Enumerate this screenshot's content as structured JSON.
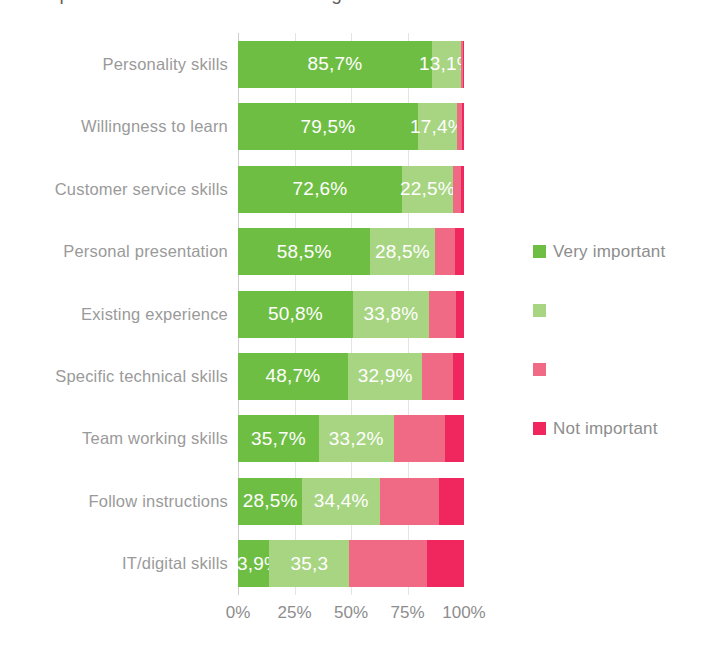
{
  "chart": {
    "title": "Importance of skills when recruiting staff",
    "xlabel": "",
    "ylabel": ""
  },
  "axis": {
    "ticks": [
      "0%",
      "25%",
      "50%",
      "75%",
      "100%"
    ]
  },
  "legend": {
    "items": [
      {
        "label": "Very important",
        "color": "#6FBE44"
      },
      {
        "label": "",
        "color": "#A8D582"
      },
      {
        "label": "",
        "color": "#F06A85"
      },
      {
        "label": "Not important",
        "color": "#F0265E"
      }
    ]
  },
  "chart_data": {
    "type": "bar",
    "orientation": "horizontal",
    "stacked": true,
    "title": "Importance of skills when recruiting staff",
    "xlabel": "",
    "ylabel": "",
    "xlim": [
      0,
      100
    ],
    "xticks": [
      0,
      25,
      50,
      75,
      100
    ],
    "grid": true,
    "legend_position": "right",
    "categories": [
      "Personality skills",
      "Willingness to learn",
      "Customer service skills",
      "Personal presentation",
      "Existing experience",
      "Specific technical skills",
      "Team working skills",
      "Follow instructions",
      "IT/digital skills"
    ],
    "series": [
      {
        "name": "Very important",
        "color": "#6FBE44",
        "values": [
          85.7,
          79.5,
          72.6,
          58.5,
          50.8,
          48.7,
          35.7,
          28.5,
          13.9
        ],
        "labels": [
          "85,7%",
          "79,5%",
          "72,6%",
          "58,5%",
          "50,8%",
          "48,7%",
          "35,7%",
          "28,5%",
          "13,9%"
        ]
      },
      {
        "name": "",
        "color": "#A8D582",
        "values": [
          13.1,
          17.4,
          22.5,
          28.5,
          33.8,
          32.9,
          33.2,
          34.4,
          35.3
        ],
        "labels": [
          "13,1%",
          "17,4%",
          "22,5%",
          "28,5%",
          "33,8%",
          "32,9%",
          "33,2%",
          "34,4%",
          "35,3"
        ]
      },
      {
        "name": "",
        "color": "#F06A85",
        "values": [
          0.8,
          2.1,
          3.4,
          9.1,
          12.0,
          13.5,
          22.5,
          26.2,
          34.3
        ],
        "labels": [
          "",
          "",
          "",
          "",
          "",
          "",
          "",
          "",
          ""
        ]
      },
      {
        "name": "Not important",
        "color": "#F0265E",
        "values": [
          0.4,
          1.0,
          1.5,
          3.9,
          3.4,
          4.9,
          8.6,
          10.9,
          16.5
        ],
        "labels": [
          "",
          "",
          "",
          "",
          "",
          "",
          "",
          "",
          ""
        ]
      }
    ]
  }
}
